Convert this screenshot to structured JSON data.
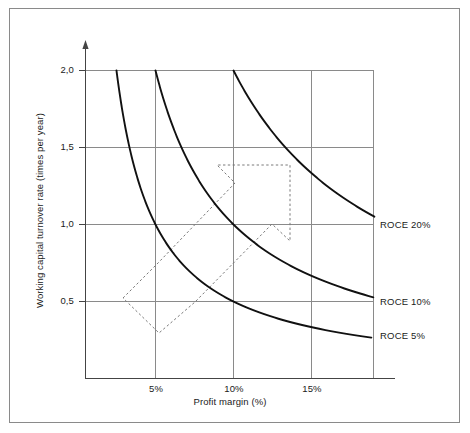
{
  "chart_data": {
    "type": "line",
    "title": "",
    "xlabel": "Profit margin (%)",
    "ylabel": "Working capital turnover rate (times per year)",
    "xlim": [
      0,
      19
    ],
    "ylim": [
      0,
      2.3
    ],
    "xticks": [
      "5%",
      "10%",
      "15%"
    ],
    "xtick_values": [
      5,
      10,
      15
    ],
    "yticks": [
      "0,5",
      "1,0",
      "1,5",
      "2,0"
    ],
    "ytick_values": [
      0.5,
      1.0,
      1.5,
      2.0
    ],
    "grid": true,
    "legend_position": "right-inline",
    "series": [
      {
        "name": "ROCE 5%",
        "label": "ROCE 5%",
        "relation": "y = 5 / x",
        "roce": 5,
        "color": "#111111",
        "points": [
          {
            "x": 2.5,
            "y": 2.0
          },
          {
            "x": 3.0,
            "y": 1.667
          },
          {
            "x": 3.5,
            "y": 1.429
          },
          {
            "x": 4.0,
            "y": 1.25
          },
          {
            "x": 5.0,
            "y": 1.0
          },
          {
            "x": 6.0,
            "y": 0.833
          },
          {
            "x": 7.0,
            "y": 0.714
          },
          {
            "x": 8.0,
            "y": 0.625
          },
          {
            "x": 10.0,
            "y": 0.5
          },
          {
            "x": 12.0,
            "y": 0.417
          },
          {
            "x": 14.0,
            "y": 0.357
          },
          {
            "x": 16.0,
            "y": 0.3125
          },
          {
            "x": 19.0,
            "y": 0.263
          }
        ]
      },
      {
        "name": "ROCE 10%",
        "label": "ROCE 10%",
        "relation": "y = 10 / x",
        "roce": 10,
        "color": "#111111",
        "points": [
          {
            "x": 5.0,
            "y": 2.0
          },
          {
            "x": 6.0,
            "y": 1.667
          },
          {
            "x": 7.0,
            "y": 1.429
          },
          {
            "x": 8.0,
            "y": 1.25
          },
          {
            "x": 10.0,
            "y": 1.0
          },
          {
            "x": 12.0,
            "y": 0.833
          },
          {
            "x": 14.0,
            "y": 0.714
          },
          {
            "x": 16.0,
            "y": 0.625
          },
          {
            "x": 19.0,
            "y": 0.526
          }
        ]
      },
      {
        "name": "ROCE 20%",
        "label": "ROCE 20%",
        "relation": "y = 20 / x",
        "roce": 20,
        "color": "#111111",
        "points": [
          {
            "x": 10.0,
            "y": 2.0
          },
          {
            "x": 11.0,
            "y": 1.818
          },
          {
            "x": 12.0,
            "y": 1.667
          },
          {
            "x": 13.0,
            "y": 1.538
          },
          {
            "x": 14.0,
            "y": 1.429
          },
          {
            "x": 15.0,
            "y": 1.333
          },
          {
            "x": 16.0,
            "y": 1.25
          },
          {
            "x": 17.0,
            "y": 1.176
          },
          {
            "x": 18.0,
            "y": 1.111
          },
          {
            "x": 19.0,
            "y": 1.053
          }
        ]
      }
    ],
    "annotations": [
      {
        "name": "improvement-arrow",
        "type": "dashed-arrow-polygon",
        "style": "dashed",
        "color": "#7a7a7a",
        "description": "Dashed arrow pointing up and to the right, indicating simultaneous improvement of profit margin and working capital turnover rate",
        "vertices_px": [
          [
            123,
            298
          ],
          [
            159,
            262
          ],
          [
            235,
            183
          ],
          [
            217,
            165
          ],
          [
            290,
            165
          ],
          [
            290,
            241
          ],
          [
            272,
            224
          ],
          [
            195,
            302
          ],
          [
            159,
            333
          ]
        ]
      }
    ]
  },
  "axes": {
    "x_title": "Profit margin (%)",
    "y_title": "Working capital turnover rate (times per year)",
    "x_tick_labels": [
      "5%",
      "10%",
      "15%"
    ],
    "y_tick_labels": [
      "2,0",
      "1,5",
      "1,0",
      "0,5"
    ]
  },
  "series_labels": {
    "roce20": "ROCE 20%",
    "roce10": "ROCE 10%",
    "roce5": "ROCE 5%"
  },
  "colors": {
    "curve": "#111111",
    "grid": "#8a8a8a",
    "axis": "#444444",
    "annotation": "#7a7a7a",
    "border": "#8a8a8a",
    "background": "#ffffff"
  }
}
